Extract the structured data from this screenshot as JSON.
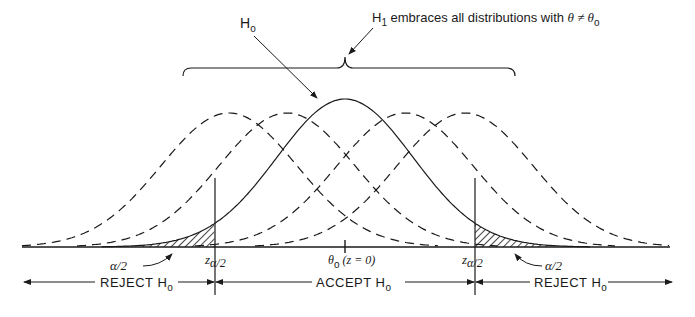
{
  "labels": {
    "h0": "H",
    "h0_sub": "o",
    "h1": "H",
    "h1_sub": "1",
    "h1_desc": " embraces all distributions with ",
    "theta_neq": "θ ≠ θ",
    "theta_sub": "o",
    "alpha_half_left": "α/2",
    "alpha_half_right": "α/2",
    "z_crit_left": "z",
    "z_crit_left_sub": "α/2",
    "z_crit_right": "z",
    "z_crit_right_sub": "α/2",
    "center_theta": "θ",
    "center_theta_sub": "o",
    "center_z": " (z = 0)",
    "reject_left": "REJECT H",
    "reject_left_sub": "o",
    "accept": "ACCEPT H",
    "accept_sub": "o",
    "reject_right": "REJECT H",
    "reject_right_sub": "o"
  },
  "colors": {
    "ink": "#1a1a1a",
    "background": "#ffffff"
  },
  "geometry": {
    "baseline_y": 247,
    "axis_x_start": 22,
    "axis_x_end": 670,
    "sigma_px": 68,
    "null_center_x": 345,
    "null_peak_y": 99,
    "alt_peak_y": 113,
    "alt_centers_x": [
      229,
      287,
      405,
      465
    ],
    "critical_left_x": 215,
    "critical_right_x": 475
  }
}
